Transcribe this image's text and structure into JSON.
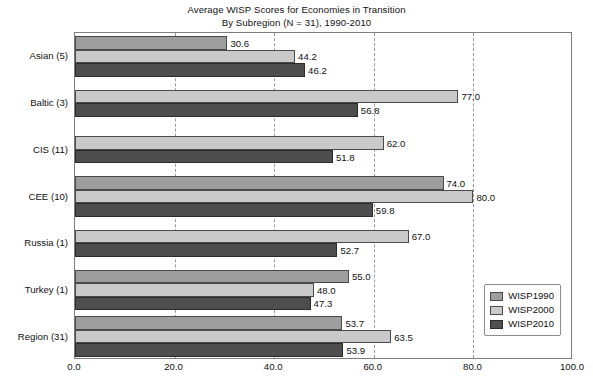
{
  "chart_data": {
    "type": "bar",
    "orientation": "horizontal",
    "title": "Average WISP Scores for Economies in Transition",
    "subtitle": "By Subregion (N = 31), 1990-2010",
    "xlabel": "",
    "ylabel": "",
    "xlim": [
      0.0,
      100.0
    ],
    "xticks": [
      "0.0",
      "20.0",
      "40.0",
      "60.0",
      "80.0",
      "100.0"
    ],
    "xtick_values": [
      0,
      20,
      40,
      60,
      80,
      100
    ],
    "grid": "vertical dashed gridlines at 20.0, 40.0, 60.0, 80.0",
    "legend_position": "bottom-right inside plot area",
    "categories": [
      "Asian (5)",
      "Baltic (3)",
      "CIS (11)",
      "CEE (10)",
      "Russia (1)",
      "Turkey (1)",
      "Region (31)"
    ],
    "series": [
      {
        "name": "WISP1990",
        "color": "#9d9d9d",
        "values": [
          30.6,
          null,
          null,
          74.0,
          null,
          55.0,
          53.7
        ],
        "labels": [
          "30.6",
          "",
          "",
          "74.0",
          "",
          "55.0",
          "53.7"
        ]
      },
      {
        "name": "WISP2000",
        "color": "#c9c9c9",
        "values": [
          44.2,
          77.0,
          62.0,
          80.0,
          67.0,
          48.0,
          63.5
        ],
        "labels": [
          "44.2",
          "77.0",
          "62.0",
          "80.0",
          "67.0",
          "48.0",
          "63.5"
        ]
      },
      {
        "name": "WISP2010",
        "color": "#4e4e4e",
        "values": [
          46.2,
          56.8,
          51.8,
          59.8,
          52.7,
          47.3,
          53.9
        ],
        "labels": [
          "46.2",
          "56.8",
          "51.8",
          "59.8",
          "52.7",
          "47.3",
          "53.9"
        ]
      }
    ]
  },
  "legend": {
    "items": [
      {
        "label": "WISP1990",
        "series_class": "s1990"
      },
      {
        "label": "WISP2000",
        "series_class": "s2000"
      },
      {
        "label": "WISP2010",
        "series_class": "s2010"
      }
    ]
  }
}
